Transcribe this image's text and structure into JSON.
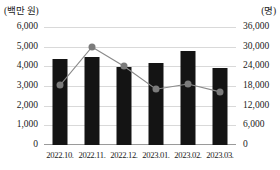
{
  "chart_data": {
    "type": "bar",
    "title": "",
    "xlabel": "",
    "categories": [
      "2022.10.",
      "2022.11.",
      "2022.12.",
      "2023.01.",
      "2023.02.",
      "2023.03."
    ],
    "grid": true,
    "legend": "none",
    "axes": {
      "left": {
        "unit_label": "(백만 원)",
        "ylim": [
          0,
          6000
        ],
        "ticks": [
          0,
          1000,
          2000,
          3000,
          4000,
          5000,
          6000
        ],
        "tick_labels": [
          "0",
          "1,000",
          "2,000",
          "3,000",
          "4,000",
          "5,000",
          "6,000"
        ]
      },
      "right": {
        "unit_label": "(명)",
        "ylim": [
          0,
          36000
        ],
        "ticks": [
          0,
          6000,
          12000,
          18000,
          24000,
          30000,
          36000
        ],
        "tick_labels": [
          "0",
          "6,000",
          "12,000",
          "18,000",
          "24,000",
          "30,000",
          "36,000"
        ]
      }
    },
    "series": [
      {
        "name": "금액",
        "type": "bar",
        "axis": "left",
        "color": "#141414",
        "values": [
          4350,
          4450,
          3950,
          4180,
          4790,
          3920
        ]
      },
      {
        "name": "인원",
        "type": "line",
        "axis": "right",
        "color": "#7b7b7b",
        "marker": "circle",
        "values": [
          18200,
          29900,
          24000,
          17000,
          18600,
          16200
        ]
      }
    ]
  }
}
